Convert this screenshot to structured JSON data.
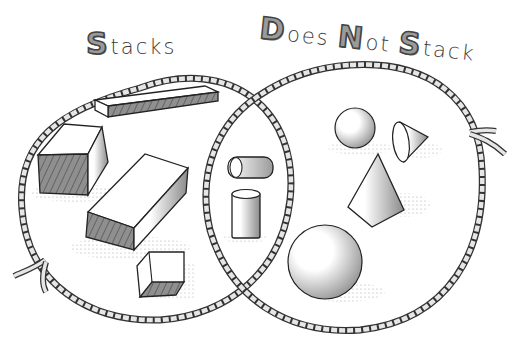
{
  "diagram": {
    "type": "venn",
    "sets": [
      {
        "id": "left",
        "label": {
          "cap": "S",
          "rest": "tacks"
        },
        "full_label": "Stacks",
        "items": [
          "long thin rectangular block",
          "cube-like block",
          "large rectangular block",
          "small cube"
        ]
      },
      {
        "id": "right",
        "label_words": [
          {
            "cap": "D",
            "rest": "oes"
          },
          {
            "cap": "N",
            "rest": "ot"
          },
          {
            "cap": "S",
            "rest": "tack"
          }
        ],
        "full_label": "Does Not Stack",
        "items": [
          "small sphere",
          "tilted cone",
          "upright cone",
          "large sphere"
        ]
      }
    ],
    "intersection": {
      "items": [
        "cylinder lying on its side",
        "upright cylinder"
      ]
    },
    "colors": {
      "rope": "#d9d9d9",
      "rope_outline": "#333333",
      "ink": "#2b2b2b",
      "shadow": "#8a8a8a",
      "letter_fill": "#9a9a9a"
    }
  }
}
